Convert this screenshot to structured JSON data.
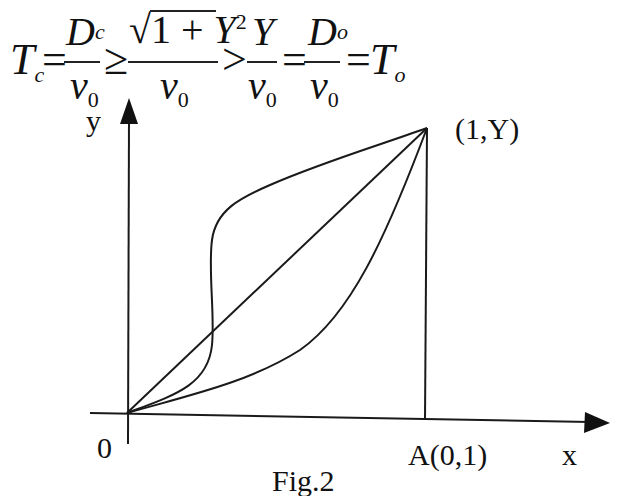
{
  "equation": {
    "lhs": {
      "symbol": "T",
      "sub": "c"
    },
    "eq1": "=",
    "frac1": {
      "num_symbol": "D",
      "num_sub": "c",
      "den_symbol": "v",
      "den_sub": "0"
    },
    "rel1": "≥",
    "frac2": {
      "num_root_body": "1 + ",
      "num_var": "Y",
      "num_sup": "2",
      "radical": "√",
      "den_symbol": "v",
      "den_sub": "0"
    },
    "rel2": ">",
    "frac3": {
      "num_symbol": "Y",
      "den_symbol": "v",
      "den_sub": "0"
    },
    "eq2": "=",
    "frac4": {
      "num_symbol": "D",
      "num_sub": "o",
      "den_symbol": "v",
      "den_sub": "0"
    },
    "eq3": "=",
    "rhs": {
      "symbol": "T",
      "sub": "o"
    }
  },
  "diagram": {
    "y_axis_label": "y",
    "x_axis_label": "x",
    "origin_label": "0",
    "point_top_label": "(1,Y)",
    "point_a_label": "A(0,1)",
    "caption": "Fig.2",
    "paths": [
      {
        "name": "straight-line-path",
        "description": "direct line from 0 to (1,Y)"
      },
      {
        "name": "s-curve-path",
        "description": "S-shaped curve from 0 to (1,Y)"
      },
      {
        "name": "convex-curve-path",
        "description": "lower convex curve from 0 to (1,Y)"
      }
    ],
    "stroke_color": "#1a1a1a"
  }
}
